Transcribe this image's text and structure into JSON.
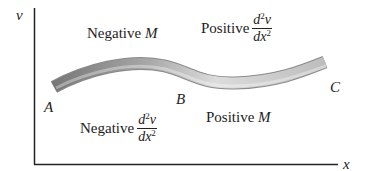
{
  "diagram": {
    "axes": {
      "y_label": "v",
      "x_label": "x"
    },
    "points": {
      "a": "A",
      "b": "B",
      "c": "C"
    },
    "regions": {
      "top_left": {
        "word": "Negative",
        "symbol": "M"
      },
      "top_right": {
        "word": "Positive",
        "num": "d",
        "num_sup": "2",
        "num_var": "v",
        "den": "dx",
        "den_sup": "2"
      },
      "bottom_left": {
        "word": "Negative",
        "num": "d",
        "num_sup": "2",
        "num_var": "v",
        "den": "dx",
        "den_sup": "2"
      },
      "bottom_right": {
        "word": "Positive",
        "symbol": "M"
      }
    },
    "colors": {
      "axis": "#222222",
      "beam_dark": "#7a7a7a",
      "beam_light": "#e0e0e0"
    }
  }
}
